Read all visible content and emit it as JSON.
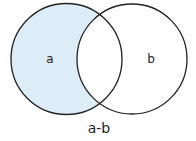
{
  "diagram": {
    "type": "venn",
    "operation": "set difference",
    "sets": [
      {
        "id": "a",
        "label": "a",
        "shaded": true
      },
      {
        "id": "b",
        "label": "b",
        "shaded": false
      }
    ],
    "caption": "a-b",
    "colors": {
      "shade": "#dcedf8",
      "stroke": "#222222",
      "background": "#ffffff"
    }
  }
}
